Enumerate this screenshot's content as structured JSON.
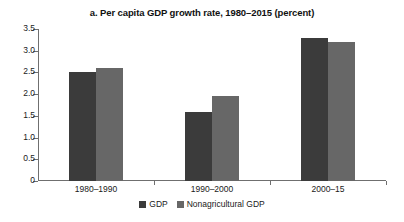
{
  "chart_data": {
    "type": "bar",
    "title": "a. Per capita GDP growth rate, 1980–2015 (percent)",
    "xlabel": "",
    "ylabel": "",
    "categories": [
      "1980–1990",
      "1990–2000",
      "2000–15"
    ],
    "series": [
      {
        "name": "GDP",
        "color": "#3b3b3b",
        "values": [
          2.5,
          1.6,
          3.3
        ]
      },
      {
        "name": "Nonagricultural GDP",
        "color": "#676767",
        "values": [
          2.6,
          1.95,
          3.2
        ]
      }
    ],
    "ylim": [
      0,
      3.5
    ],
    "ytick_labels": [
      "0",
      "0.5",
      "1.0",
      "1.5",
      "2.0",
      "2.5",
      "3.0",
      "3.5"
    ],
    "ytick_values": [
      0,
      0.5,
      1.0,
      1.5,
      2.0,
      2.5,
      3.0,
      3.5
    ],
    "grid": false,
    "legend_position": "bottom"
  }
}
